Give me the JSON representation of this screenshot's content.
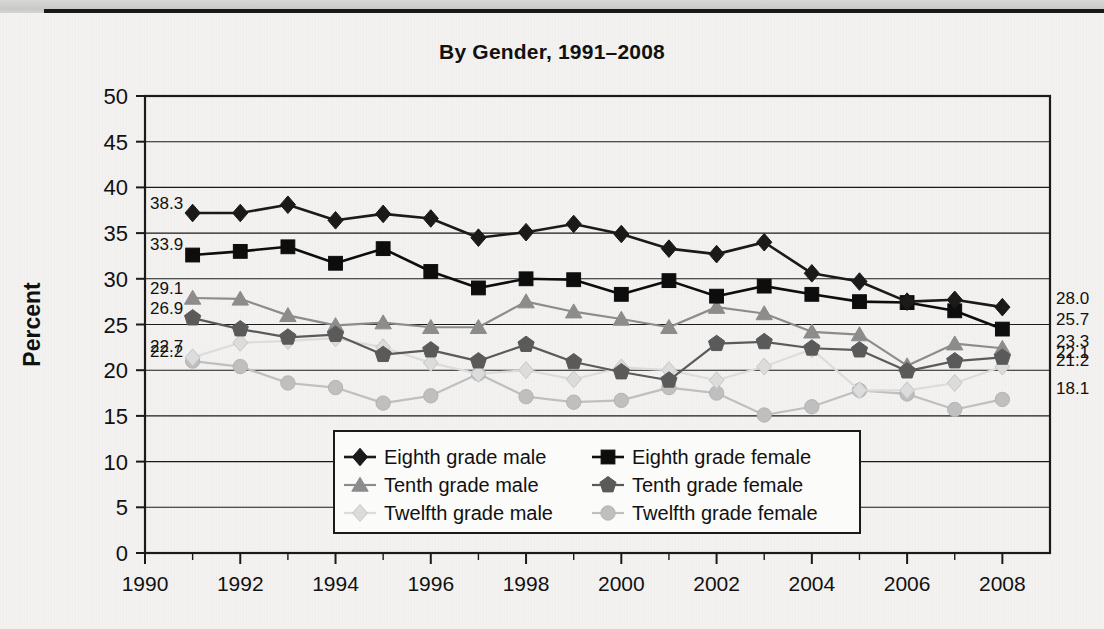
{
  "page": {
    "background_color": "#f4f3f1",
    "top_band_color": "#cfcfcd",
    "rule_color": "#191919"
  },
  "chart_data": {
    "type": "line",
    "title": "By Gender, 1991–2008",
    "xlabel": "",
    "ylabel": "Percent",
    "xlim": [
      1990,
      2009
    ],
    "ylim": [
      0,
      50
    ],
    "ytick_step": 5,
    "grid": true,
    "legend_position": "inside-bottom-center",
    "x": [
      1991,
      1992,
      1993,
      1994,
      1995,
      1996,
      1997,
      1998,
      1999,
      2000,
      2001,
      2002,
      2003,
      2004,
      2005,
      2006,
      2007,
      2008
    ],
    "xticks": [
      "1990",
      "1992",
      "1994",
      "1996",
      "1998",
      "2000",
      "2002",
      "2004",
      "2006",
      "2008"
    ],
    "yticks": [
      "0",
      "5",
      "10",
      "15",
      "20",
      "25",
      "30",
      "35",
      "40",
      "45",
      "50"
    ],
    "series": [
      {
        "name": "Eighth grade male",
        "marker": "diamond",
        "color": "#1a1a1a",
        "start_label": "38.3",
        "end_label": "28.0",
        "values": [
          37.2,
          37.2,
          38.1,
          36.4,
          37.1,
          36.6,
          34.5,
          35.1,
          36.0,
          34.9,
          33.3,
          32.7,
          34.0,
          30.6,
          29.7,
          27.5,
          27.7,
          26.9
        ]
      },
      {
        "name": "Eighth grade female",
        "marker": "square",
        "color": "#0d0d0d",
        "start_label": "33.9",
        "end_label": "25.7",
        "values": [
          32.6,
          33.0,
          33.5,
          31.7,
          33.3,
          30.8,
          29.0,
          30.0,
          29.9,
          28.3,
          29.8,
          28.1,
          29.2,
          28.3,
          27.5,
          27.4,
          26.5,
          24.5
        ]
      },
      {
        "name": "Tenth grade male",
        "marker": "triangle",
        "color": "#8c8c8c",
        "start_label": "29.1",
        "end_label": "23.3",
        "values": [
          27.9,
          27.8,
          26.0,
          24.9,
          25.2,
          24.7,
          24.7,
          27.5,
          26.4,
          25.6,
          24.7,
          26.9,
          26.2,
          24.2,
          23.9,
          20.5,
          22.9,
          22.4
        ]
      },
      {
        "name": "Tenth grade female",
        "marker": "pentagon",
        "color": "#5a5a5a",
        "start_label": "26.9",
        "end_label": "22.1",
        "values": [
          25.7,
          24.5,
          23.6,
          23.9,
          21.7,
          22.2,
          21.0,
          22.8,
          20.9,
          19.8,
          18.9,
          22.9,
          23.1,
          22.4,
          22.2,
          19.9,
          21.0,
          21.4
        ]
      },
      {
        "name": "Twelfth grade male",
        "marker": "diamond-open",
        "color": "#dcdcdc",
        "start_label": "22.7",
        "end_label": "21.2",
        "values": [
          21.4,
          23.0,
          23.2,
          23.5,
          22.5,
          20.8,
          19.6,
          20.0,
          19.0,
          20.3,
          20.0,
          18.9,
          20.4,
          22.3,
          17.8,
          17.8,
          18.6,
          20.4
        ]
      },
      {
        "name": "Twelfth grade female",
        "marker": "circle",
        "color": "#bfbfbf",
        "start_label": "22.2",
        "end_label": "18.1",
        "values": [
          21.0,
          20.4,
          18.6,
          18.1,
          16.4,
          17.2,
          19.6,
          17.1,
          16.5,
          16.7,
          18.1,
          17.5,
          15.1,
          16.0,
          17.8,
          17.4,
          15.7,
          16.8
        ]
      }
    ]
  }
}
